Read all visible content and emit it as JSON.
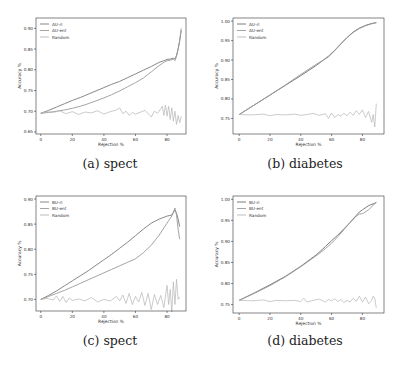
{
  "chart_data": [
    {
      "id": "a",
      "type": "line",
      "caption": "(a) spect",
      "xlabel": "Rejection %",
      "ylabel": "Accuracy %",
      "xticks": [
        0,
        20,
        40,
        60,
        80
      ],
      "yticks": [
        "0.65",
        "0.70",
        "0.75",
        "0.80",
        "0.85",
        "0.90"
      ],
      "xlim": [
        -3,
        92
      ],
      "ylim": [
        0.645,
        0.925
      ],
      "legend": [
        "AU-rl",
        "AU-ent",
        "Random"
      ],
      "legend_position": "upper left",
      "grid": false,
      "series": [
        {
          "name": "AU-rl",
          "color": "#7a7a7a",
          "x": [
            0,
            5,
            10,
            15,
            20,
            25,
            30,
            35,
            40,
            45,
            50,
            55,
            60,
            65,
            70,
            75,
            78,
            80,
            82,
            84,
            85,
            86,
            87,
            88,
            89
          ],
          "y": [
            0.695,
            0.702,
            0.71,
            0.718,
            0.726,
            0.733,
            0.741,
            0.749,
            0.757,
            0.765,
            0.772,
            0.781,
            0.79,
            0.799,
            0.808,
            0.818,
            0.822,
            0.825,
            0.826,
            0.828,
            0.826,
            0.835,
            0.85,
            0.87,
            0.895
          ]
        },
        {
          "name": "AU-ent",
          "color": "#9a9a9a",
          "x": [
            0,
            5,
            10,
            15,
            20,
            25,
            30,
            35,
            40,
            45,
            50,
            55,
            60,
            65,
            70,
            75,
            78,
            80,
            82,
            84,
            85,
            86,
            87,
            88,
            89
          ],
          "y": [
            0.695,
            0.697,
            0.7,
            0.703,
            0.707,
            0.712,
            0.718,
            0.725,
            0.732,
            0.74,
            0.749,
            0.759,
            0.769,
            0.78,
            0.795,
            0.81,
            0.818,
            0.822,
            0.823,
            0.826,
            0.822,
            0.832,
            0.85,
            0.87,
            0.9
          ]
        },
        {
          "name": "Random",
          "color": "#b5b5b5",
          "x": [
            0,
            4,
            8,
            12,
            16,
            20,
            24,
            28,
            32,
            36,
            40,
            44,
            48,
            50,
            52,
            54,
            56,
            58,
            60,
            64,
            66,
            68,
            70,
            72,
            74,
            76,
            77,
            78,
            79,
            80,
            81,
            82,
            83,
            84,
            85,
            86,
            87,
            88,
            89
          ],
          "y": [
            0.695,
            0.699,
            0.697,
            0.701,
            0.694,
            0.699,
            0.692,
            0.698,
            0.696,
            0.701,
            0.693,
            0.699,
            0.703,
            0.708,
            0.694,
            0.7,
            0.69,
            0.697,
            0.693,
            0.699,
            0.702,
            0.694,
            0.686,
            0.7,
            0.695,
            0.706,
            0.712,
            0.69,
            0.715,
            0.688,
            0.712,
            0.68,
            0.708,
            0.676,
            0.7,
            0.668,
            0.69,
            0.672,
            0.688
          ]
        }
      ]
    },
    {
      "id": "b",
      "type": "line",
      "caption": "(b) diabetes",
      "xlabel": "Rejection %",
      "ylabel": "Accuracy %",
      "xticks": [
        0,
        20,
        40,
        60,
        80
      ],
      "yticks": [
        "0.75",
        "0.80",
        "0.85",
        "0.90",
        "0.95",
        "1.00"
      ],
      "xlim": [
        -4,
        94
      ],
      "ylim": [
        0.71,
        1.008
      ],
      "legend": [
        "AU-rl",
        "AU-ent",
        "Random"
      ],
      "legend_position": "upper left",
      "grid": false,
      "series": [
        {
          "name": "AU-rl",
          "color": "#6e6e6e",
          "x": [
            0,
            10,
            20,
            30,
            40,
            50,
            58,
            62,
            66,
            70,
            74,
            78,
            82,
            86,
            89
          ],
          "y": [
            0.76,
            0.785,
            0.81,
            0.835,
            0.86,
            0.886,
            0.91,
            0.925,
            0.942,
            0.958,
            0.972,
            0.982,
            0.989,
            0.994,
            0.996
          ]
        },
        {
          "name": "AU-ent",
          "color": "#9a9a9a",
          "x": [
            0,
            10,
            20,
            30,
            40,
            50,
            58,
            62,
            66,
            70,
            74,
            78,
            82,
            86,
            89
          ],
          "y": [
            0.76,
            0.785,
            0.81,
            0.836,
            0.863,
            0.889,
            0.908,
            0.924,
            0.941,
            0.957,
            0.971,
            0.981,
            0.988,
            0.993,
            0.996
          ]
        },
        {
          "name": "Random",
          "color": "#b5b5b5",
          "x": [
            0,
            8,
            16,
            20,
            24,
            30,
            36,
            40,
            44,
            48,
            52,
            56,
            58,
            60,
            62,
            64,
            66,
            68,
            70,
            72,
            74,
            76,
            78,
            80,
            82,
            84,
            86,
            87,
            88,
            89
          ],
          "y": [
            0.76,
            0.759,
            0.761,
            0.757,
            0.76,
            0.759,
            0.761,
            0.758,
            0.76,
            0.763,
            0.758,
            0.762,
            0.75,
            0.764,
            0.752,
            0.76,
            0.756,
            0.763,
            0.757,
            0.766,
            0.758,
            0.77,
            0.76,
            0.772,
            0.752,
            0.768,
            0.74,
            0.76,
            0.728,
            0.788
          ]
        }
      ]
    },
    {
      "id": "c",
      "type": "line",
      "caption": "(c) spect",
      "xlabel": "Rejection %",
      "ylabel": "Accuracy %",
      "xticks": [
        0,
        20,
        40,
        60,
        80
      ],
      "yticks": [
        "0.70",
        "0.75",
        "0.80",
        "0.85",
        "0.90"
      ],
      "xlim": [
        -3,
        92
      ],
      "ylim": [
        0.677,
        0.906
      ],
      "legend": [
        "BU-rl",
        "BU-ent",
        "Random"
      ],
      "legend_position": "upper left",
      "grid": false,
      "series": [
        {
          "name": "BU-rl",
          "color": "#7a7a7a",
          "x": [
            0,
            5,
            10,
            15,
            20,
            25,
            30,
            35,
            40,
            45,
            50,
            55,
            60,
            65,
            70,
            75,
            80,
            83,
            85,
            86,
            87,
            88
          ],
          "y": [
            0.7,
            0.708,
            0.717,
            0.727,
            0.737,
            0.747,
            0.757,
            0.768,
            0.779,
            0.79,
            0.802,
            0.814,
            0.827,
            0.84,
            0.852,
            0.86,
            0.866,
            0.868,
            0.878,
            0.872,
            0.86,
            0.845
          ]
        },
        {
          "name": "BU-ent",
          "color": "#9a9a9a",
          "x": [
            0,
            5,
            10,
            15,
            20,
            25,
            30,
            35,
            40,
            45,
            50,
            55,
            60,
            65,
            70,
            75,
            80,
            83,
            85,
            86,
            87,
            88
          ],
          "y": [
            0.7,
            0.706,
            0.712,
            0.718,
            0.725,
            0.732,
            0.739,
            0.746,
            0.753,
            0.76,
            0.767,
            0.774,
            0.781,
            0.793,
            0.808,
            0.828,
            0.852,
            0.866,
            0.882,
            0.868,
            0.84,
            0.82
          ]
        },
        {
          "name": "Random",
          "color": "#b5b5b5",
          "x": [
            0,
            4,
            8,
            10,
            12,
            14,
            16,
            18,
            20,
            24,
            28,
            32,
            36,
            40,
            44,
            48,
            50,
            52,
            54,
            56,
            58,
            60,
            62,
            64,
            66,
            68,
            70,
            72,
            74,
            76,
            78,
            80,
            81,
            82,
            83,
            84,
            85,
            86,
            87,
            88
          ],
          "y": [
            0.7,
            0.702,
            0.699,
            0.707,
            0.696,
            0.706,
            0.694,
            0.703,
            0.698,
            0.701,
            0.697,
            0.704,
            0.695,
            0.7,
            0.697,
            0.706,
            0.697,
            0.709,
            0.692,
            0.712,
            0.69,
            0.706,
            0.695,
            0.714,
            0.688,
            0.712,
            0.68,
            0.71,
            0.69,
            0.708,
            0.684,
            0.728,
            0.69,
            0.72,
            0.675,
            0.735,
            0.69,
            0.74,
            0.7,
            0.705
          ]
        }
      ]
    },
    {
      "id": "d",
      "type": "line",
      "caption": "(d) diabetes",
      "xlabel": "Rejection %",
      "ylabel": "Accuracy %",
      "xticks": [
        0,
        20,
        40,
        60,
        80
      ],
      "yticks": [
        "0.75",
        "0.80",
        "0.85",
        "0.90",
        "0.95",
        "1.00"
      ],
      "xlim": [
        -4,
        94
      ],
      "ylim": [
        0.73,
        1.008
      ],
      "legend": [
        "BU-rl",
        "BU-ent",
        "Random"
      ],
      "legend_position": "upper left",
      "grid": false,
      "series": [
        {
          "name": "BU-rl",
          "color": "#6e6e6e",
          "x": [
            0,
            10,
            20,
            30,
            40,
            50,
            56,
            60,
            64,
            68,
            72,
            76,
            78,
            80,
            84,
            88,
            89
          ],
          "y": [
            0.76,
            0.778,
            0.797,
            0.817,
            0.841,
            0.868,
            0.888,
            0.902,
            0.915,
            0.93,
            0.945,
            0.962,
            0.97,
            0.975,
            0.985,
            0.991,
            0.992
          ]
        },
        {
          "name": "BU-ent",
          "color": "#9a9a9a",
          "x": [
            0,
            10,
            20,
            30,
            40,
            50,
            56,
            60,
            64,
            68,
            72,
            76,
            78,
            80,
            84,
            88,
            89
          ],
          "y": [
            0.76,
            0.777,
            0.795,
            0.816,
            0.84,
            0.866,
            0.883,
            0.896,
            0.911,
            0.928,
            0.945,
            0.96,
            0.965,
            0.966,
            0.975,
            0.99,
            0.993
          ]
        },
        {
          "name": "Random",
          "color": "#b5b5b5",
          "x": [
            0,
            8,
            16,
            20,
            24,
            30,
            36,
            40,
            42,
            44,
            48,
            52,
            56,
            58,
            60,
            62,
            64,
            66,
            68,
            70,
            72,
            74,
            76,
            78,
            80,
            82,
            84,
            86,
            87,
            88,
            89
          ],
          "y": [
            0.76,
            0.759,
            0.761,
            0.757,
            0.76,
            0.759,
            0.76,
            0.757,
            0.765,
            0.756,
            0.76,
            0.763,
            0.756,
            0.762,
            0.759,
            0.764,
            0.757,
            0.762,
            0.755,
            0.76,
            0.756,
            0.765,
            0.758,
            0.77,
            0.756,
            0.768,
            0.752,
            0.76,
            0.77,
            0.765,
            0.742
          ]
        }
      ]
    }
  ],
  "panels": [
    {
      "caption": "(a) spect",
      "frame": {
        "left": 36,
        "top": 18,
        "right": 186,
        "bottom": 134
      },
      "caption_pos": {
        "x": 110,
        "y": 156
      }
    },
    {
      "caption": "(b) diabetes",
      "frame": {
        "left": 233,
        "top": 18,
        "right": 384,
        "bottom": 134
      },
      "caption_pos": {
        "x": 305,
        "y": 156
      }
    },
    {
      "caption": "(c) spect",
      "frame": {
        "left": 36,
        "top": 196,
        "right": 186,
        "bottom": 311
      },
      "caption_pos": {
        "x": 110,
        "y": 333
      }
    },
    {
      "caption": "(d) diabetes",
      "frame": {
        "left": 233,
        "top": 196,
        "right": 384,
        "bottom": 313
      },
      "caption_pos": {
        "x": 305,
        "y": 333
      }
    }
  ]
}
